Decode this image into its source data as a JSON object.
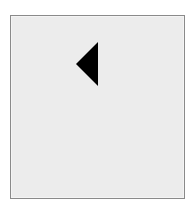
{
  "panel": {
    "background": "#ececec",
    "border_color": "#8a8a8a"
  },
  "arrow_button": {
    "icon": "triangle-left-icon",
    "direction": "left",
    "color": "#000000"
  }
}
